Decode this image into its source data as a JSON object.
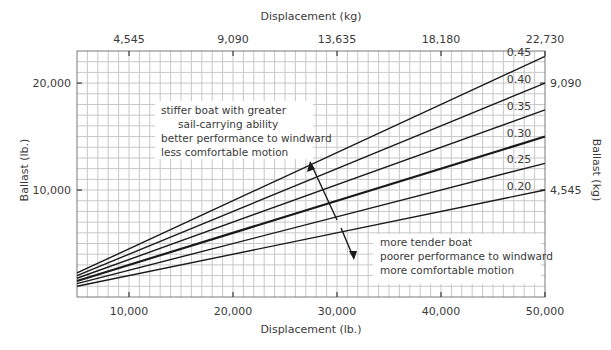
{
  "chart_data": {
    "type": "line",
    "title": "",
    "xlabel": "Displacement (lb.)",
    "ylabel": "Ballast (lb.)",
    "x2label": "Displacement (kg)",
    "y2label": "Ballast (kg)",
    "xlim": [
      5000,
      50000
    ],
    "ylim": [
      0,
      23000
    ],
    "x_ticks": [
      10000,
      20000,
      30000,
      40000,
      50000
    ],
    "x_tick_labels": [
      "10,000",
      "20,000",
      "30,000",
      "40,000",
      "50,000"
    ],
    "y_ticks": [
      10000,
      20000
    ],
    "y_tick_labels": [
      "10,000",
      "20,000"
    ],
    "x2_ticks_lb": [
      10000,
      20000,
      30000,
      40000,
      50000
    ],
    "x2_tick_labels": [
      "4,545",
      "9,090",
      "13,635",
      "18,180",
      "22,730"
    ],
    "y2_ticks_lb": [
      10000,
      20000
    ],
    "y2_tick_labels": [
      "4,545",
      "9,090"
    ],
    "grid": true,
    "series": [
      {
        "name": "0.45",
        "ratio": 0.45,
        "x": [
          5000,
          50000
        ],
        "values": [
          2250,
          22500
        ]
      },
      {
        "name": "0.40",
        "ratio": 0.4,
        "x": [
          5000,
          50000
        ],
        "values": [
          2000,
          20000
        ]
      },
      {
        "name": "0.35",
        "ratio": 0.35,
        "x": [
          5000,
          50000
        ],
        "values": [
          1750,
          17500
        ]
      },
      {
        "name": "0.30",
        "ratio": 0.3,
        "x": [
          5000,
          50000
        ],
        "values": [
          1500,
          15000
        ],
        "bold": true
      },
      {
        "name": "0.25",
        "ratio": 0.25,
        "x": [
          5000,
          50000
        ],
        "values": [
          1250,
          12500
        ]
      },
      {
        "name": "0.20",
        "ratio": 0.2,
        "x": [
          5000,
          50000
        ],
        "values": [
          1000,
          10000
        ]
      }
    ],
    "annotations": {
      "upper": [
        "stiffer boat with greater",
        "sail-carrying ability",
        "better performance to windward",
        "less comfortable motion"
      ],
      "lower": [
        "more tender boat",
        "poorer performance to windward",
        "more comfortable motion"
      ]
    }
  },
  "colors": {
    "grid": "#c8c8c8",
    "line": "#1a1a1a",
    "text": "#3a3a3a",
    "frame": "#7a7a7a"
  }
}
